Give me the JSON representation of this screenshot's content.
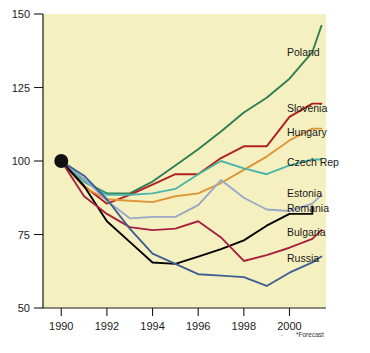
{
  "figure": {
    "background_color": "#f5f0bf",
    "page_color": "#ffffff",
    "footnote": "*Forecast",
    "stray_mark": "."
  },
  "axes": {
    "y_ticks": [
      "150",
      "125",
      "100",
      "75",
      "50"
    ],
    "y_values": [
      150,
      125,
      100,
      75,
      50
    ],
    "x_ticks": [
      "1990",
      "1992",
      "1994",
      "1996",
      "1998",
      "2000"
    ],
    "x_values": [
      1990,
      1992,
      1994,
      1996,
      1998,
      2000
    ],
    "origin_marker": "origin-dot-1990-100"
  },
  "chart_data": {
    "type": "line",
    "title": "",
    "subtitle": "",
    "xlabel": "",
    "ylabel": "",
    "xlim": [
      1989.2,
      2001.6
    ],
    "ylim": [
      50,
      150
    ],
    "grid": false,
    "legend_position": "right-inline-labels",
    "annotations": [
      "*Forecast"
    ],
    "x": [
      1990,
      1991,
      1992,
      1993,
      1994,
      1995,
      1996,
      1997,
      1998,
      1999,
      2000,
      2001
    ],
    "series": [
      {
        "name": "Poland",
        "color": "#2e7d55",
        "label_y": 137,
        "values": [
          100,
          93,
          89,
          89,
          93,
          98.5,
          104,
          110,
          116.5,
          121.5,
          128,
          137
        ]
      },
      {
        "name": "Slovenia",
        "color": "#b02020",
        "label_y": 118,
        "values": [
          100,
          91.5,
          85.5,
          88.5,
          92,
          95.5,
          95.5,
          101,
          105,
          105,
          115,
          119.5
        ]
      },
      {
        "name": "Hungary",
        "color": "#e09438",
        "label_y": 110,
        "values": [
          100,
          91,
          87,
          86.5,
          86,
          88,
          89,
          92.5,
          97,
          101.5,
          107,
          111
        ]
      },
      {
        "name": "Czech Rep",
        "color": "#4bb5a8",
        "label_y": 99.5,
        "values": [
          100,
          93,
          88.5,
          88.5,
          89,
          90.5,
          95.5,
          100,
          97.5,
          95.5,
          98.5,
          100.5
        ]
      },
      {
        "name": "Estonia",
        "color": "#9aa8c8",
        "label_y": 89,
        "values": [
          100,
          94,
          86.5,
          80.5,
          81,
          81,
          85,
          93.5,
          87.5,
          83.5,
          83,
          85.5
        ]
      },
      {
        "name": "Romania",
        "color": "#000000",
        "label_y": 84,
        "values": [
          100,
          91.5,
          79.5,
          72.5,
          65.5,
          65,
          67.5,
          70,
          73,
          78,
          82,
          82
        ]
      },
      {
        "name": "Bulgaria",
        "color": "#a8213f",
        "label_y": 76,
        "values": [
          100,
          88,
          82,
          77.5,
          76.5,
          77,
          79.5,
          74,
          66,
          68,
          70.5,
          73.5
        ]
      },
      {
        "name": "Russia",
        "color": "#3f5f92",
        "label_y": 67,
        "values": [
          100,
          95,
          87,
          77,
          68.5,
          65,
          61.5,
          61,
          60.5,
          57.5,
          62,
          65.5
        ]
      }
    ]
  },
  "extra_points": {
    "romania_tail": [
      2001,
      84.5
    ],
    "estonia_tail": [
      2001.4,
      88.5
    ],
    "bulgaria_tail": [
      2001.4,
      76.5
    ],
    "russia_tail": [
      2001.4,
      67.5
    ],
    "slovenia_tail": [
      2001.4,
      119.5
    ],
    "hungary_tail": [
      2001.4,
      111
    ],
    "czech_tail": [
      2001.4,
      100.5
    ],
    "poland_tail": [
      2001.4,
      146
    ]
  }
}
